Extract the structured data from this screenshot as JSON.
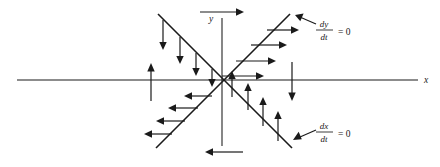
{
  "figure": {
    "kind": "phase-plane-direction-field",
    "title": "",
    "background_color": "#ffffff",
    "ink_color": "#1a1a1a"
  },
  "axes": {
    "x_label": "x",
    "y_label": "y",
    "origin": {
      "x": 222,
      "y": 80
    },
    "x_axis": {
      "x1": 17,
      "y1": 80,
      "x2": 418,
      "y2": 80
    },
    "y_axis": {
      "x1": 222,
      "y1": 18,
      "x2": 222,
      "y2": 146
    }
  },
  "nullclines": [
    {
      "name": "dy-dt-zero-nullcline",
      "equation_numerator": "dy",
      "equation_denominator": "dt",
      "equation_rhs": "= 0",
      "slope_sign": "positive",
      "x1": 156,
      "y1": 148,
      "x2": 290,
      "y2": 14
    },
    {
      "name": "dx-dt-zero-nullcline",
      "equation_numerator": "dx",
      "equation_denominator": "dt",
      "equation_rhs": "= 0",
      "slope_sign": "negative",
      "x1": 158,
      "y1": 14,
      "x2": 292,
      "y2": 148
    }
  ],
  "labels": {
    "dy_dt": {
      "numerator": "dy",
      "denominator": "dt",
      "rhs": "= 0",
      "x": 322,
      "y": 29
    },
    "dx_dt": {
      "numerator": "dx",
      "denominator": "dt",
      "rhs": "= 0",
      "x": 322,
      "y": 131
    }
  },
  "pointer_arrows": [
    {
      "name": "dy-dt-pointer",
      "x1": 316,
      "y1": 24,
      "x2": 296,
      "y2": 16
    },
    {
      "name": "dx-dt-pointer",
      "x1": 316,
      "y1": 130,
      "x2": 294,
      "y2": 139
    }
  ],
  "direction_field": {
    "quadrant_upper_left": {
      "direction": "down",
      "arrows": [
        {
          "x": 163,
          "y_start": 20,
          "y_end": 48
        },
        {
          "x": 180,
          "y_start": 37,
          "y_end": 62
        },
        {
          "x": 196,
          "y_start": 53,
          "y_end": 74
        },
        {
          "x": 212,
          "y_start": 69,
          "y_end": 85
        }
      ]
    },
    "quadrant_upper_right": {
      "direction": "right",
      "arrows": [
        {
          "y": 30,
          "x_start": 267,
          "x_end": 297
        },
        {
          "y": 45,
          "x_start": 251,
          "x_end": 285
        },
        {
          "y": 61,
          "x_start": 236,
          "x_end": 274
        },
        {
          "y": 76,
          "x_start": 222,
          "x_end": 262
        }
      ]
    },
    "quadrant_lower_left": {
      "direction": "left",
      "arrows": [
        {
          "y": 96,
          "x_start": 212,
          "x_end": 186
        },
        {
          "y": 108,
          "x_start": 198,
          "x_end": 170
        },
        {
          "y": 121,
          "x_start": 185,
          "x_end": 158
        },
        {
          "y": 134,
          "x_start": 172,
          "x_end": 146
        }
      ]
    },
    "quadrant_lower_right": {
      "direction": "up",
      "arrows": [
        {
          "x": 232,
          "y_start": 97,
          "y_end": 73
        },
        {
          "x": 248,
          "y_start": 110,
          "y_end": 85
        },
        {
          "x": 263,
          "y_start": 126,
          "y_end": 99
        },
        {
          "x": 278,
          "y_start": 141,
          "y_end": 113
        }
      ]
    },
    "axis_arrows": [
      {
        "name": "left-x-axis-up-arrow",
        "direction": "up",
        "x": 151,
        "y_start": 101,
        "y_end": 64
      },
      {
        "name": "right-x-axis-down-arrow",
        "direction": "down",
        "x": 292,
        "y_start": 62,
        "y_end": 101
      },
      {
        "name": "top-y-axis-right-arrow",
        "direction": "right",
        "y": 12,
        "x_start": 200,
        "x_end": 243
      },
      {
        "name": "bottom-y-axis-left-arrow",
        "direction": "left",
        "y": 152,
        "x_start": 243,
        "x_end": 205
      }
    ]
  }
}
